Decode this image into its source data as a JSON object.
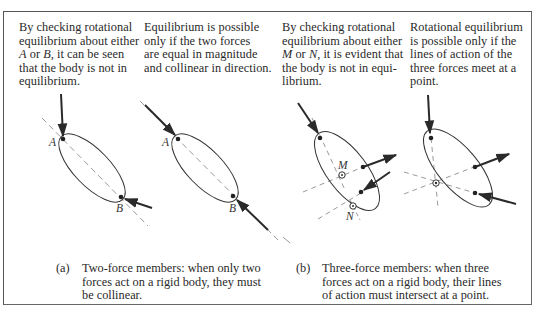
{
  "figure": {
    "notes": [
      {
        "id": "note-a-left",
        "lines": [
          "By checking rotational",
          "equilibrium about either",
          "{A} or {B}, it can be seen",
          "that the body is not in",
          "equilibrium."
        ],
        "segments": [
          {
            "text": "By checking rotational equilibrium about either "
          },
          {
            "text": "A",
            "italic": true
          },
          {
            "text": " or "
          },
          {
            "text": "B",
            "italic": true
          },
          {
            "text": ", it can be seen that the body is not in equilibrium."
          }
        ]
      },
      {
        "id": "note-a-right",
        "text": "Equilibrium is possible only if the two forces are equal in magnitude and collinear in direction."
      },
      {
        "id": "note-b-left",
        "segments": [
          {
            "text": "By checking rotational equilibrium about either "
          },
          {
            "text": "M",
            "italic": true
          },
          {
            "text": " or "
          },
          {
            "text": "N",
            "italic": true
          },
          {
            "text": ", it is evident that the body is not in equi-librium."
          }
        ]
      },
      {
        "id": "note-b-right",
        "text": "Rotational equilibrium is possible only if the lines of action of the three forces meet at a point."
      }
    ],
    "note_text": {
      "a_left_1": "By checking rotational",
      "a_left_2": "equilibrium about either",
      "a_left_3_A": "A",
      "a_left_3_or": " or ",
      "a_left_3_B": "B",
      "a_left_3_rest": ", it can be seen",
      "a_left_4": "that the body is not in",
      "a_left_5": "equilibrium.",
      "a_right_1": "Equilibrium is possible",
      "a_right_2": "only if the two forces",
      "a_right_3": "are equal in magnitude",
      "a_right_4": "and collinear in direction.",
      "b_left_1": "By checking rotational",
      "b_left_2": "equilibrium about either",
      "b_left_3_M": "M",
      "b_left_3_or": " or ",
      "b_left_3_N": "N",
      "b_left_3_rest": ", it is evident that",
      "b_left_4": "the body is not in equi-",
      "b_left_5": "librium.",
      "b_right_1": "Rotational equilibrium",
      "b_right_2": "is possible only if the",
      "b_right_3": "lines of action of the",
      "b_right_4": "three forces meet at a",
      "b_right_5": "point."
    },
    "captions": {
      "a": {
        "label": "(a)",
        "line1": "Two-force members:  when only two",
        "line2": "forces act on a rigid body, they must",
        "line3": "be collinear."
      },
      "b": {
        "label": "(b)",
        "line1": "Three-force members:  when three",
        "line2": "forces act on a rigid body, their lines",
        "line3": "of action must intersect at a point."
      }
    },
    "point_labels": {
      "d1_A": "A",
      "d1_B": "B",
      "d2_A": "A",
      "d2_B": "B",
      "d3_M": "M",
      "d3_N": "N"
    },
    "colors": {
      "ink": "#2a2a2a",
      "dashed": "#9a9a9a",
      "frame": "#555555"
    }
  }
}
